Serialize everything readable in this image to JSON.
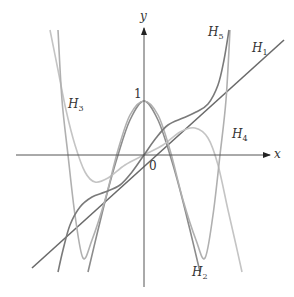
{
  "figure": {
    "axes": {
      "x_label": "x",
      "y_label": "y",
      "origin_label": "0",
      "y_tick_label": "1"
    },
    "curve_labels": [
      {
        "id": "H1",
        "base": "H",
        "sub": "1",
        "x": 252,
        "y": 42
      },
      {
        "id": "H2",
        "base": "H",
        "sub": "2",
        "x": 192,
        "y": 266
      },
      {
        "id": "H3",
        "base": "H",
        "sub": "3",
        "x": 68,
        "y": 98
      },
      {
        "id": "H4",
        "base": "H",
        "sub": "4",
        "x": 232,
        "y": 128
      },
      {
        "id": "H5",
        "base": "H",
        "sub": "5",
        "x": 208,
        "y": 26
      }
    ]
  },
  "chart_data": {
    "type": "line",
    "title": "",
    "xlabel": "x",
    "ylabel": "y",
    "grid": false,
    "legend": "inline labels",
    "annotations": [
      "1",
      "0"
    ],
    "series": [
      {
        "name": "H1",
        "color": "#6a6a6a",
        "points_px": [
          [
            32,
            268
          ],
          [
            284,
            40
          ]
        ]
      },
      {
        "name": "H2",
        "color": "#8c8c8c",
        "points_px": [
          [
            88,
            272
          ],
          [
            98,
            230
          ],
          [
            108,
            190
          ],
          [
            118,
            155
          ],
          [
            130,
            120
          ],
          [
            144,
            101
          ],
          [
            158,
            120
          ],
          [
            170,
            155
          ],
          [
            180,
            190
          ],
          [
            190,
            230
          ],
          [
            200,
            272
          ]
        ]
      },
      {
        "name": "H3",
        "color": "#c4c4c4",
        "points_px": [
          [
            50,
            30
          ],
          [
            58,
            70
          ],
          [
            66,
            110
          ],
          [
            75,
            145
          ],
          [
            85,
            172
          ],
          [
            95,
            182
          ],
          [
            108,
            178
          ],
          [
            125,
            165
          ],
          [
            144,
            155
          ],
          [
            163,
            145
          ],
          [
            180,
            132
          ],
          [
            195,
            128
          ],
          [
            208,
            138
          ],
          [
            218,
            165
          ],
          [
            228,
            210
          ],
          [
            236,
            245
          ],
          [
            242,
            272
          ]
        ]
      },
      {
        "name": "H4",
        "color": "#b0b0b0",
        "points_px": [
          [
            58,
            30
          ],
          [
            62,
            100
          ],
          [
            68,
            155
          ],
          [
            75,
            215
          ],
          [
            83,
            258
          ],
          [
            92,
            240
          ],
          [
            105,
            200
          ],
          [
            118,
            150
          ],
          [
            130,
            115
          ],
          [
            144,
            101
          ],
          [
            158,
            115
          ],
          [
            170,
            150
          ],
          [
            183,
            200
          ],
          [
            196,
            240
          ],
          [
            205,
            258
          ],
          [
            213,
            215
          ],
          [
            220,
            155
          ],
          [
            226,
            100
          ],
          [
            230,
            30
          ]
        ]
      },
      {
        "name": "H5",
        "color": "#7a7a7a",
        "points_px": [
          [
            58,
            272
          ],
          [
            63,
            250
          ],
          [
            70,
            225
          ],
          [
            80,
            207
          ],
          [
            92,
            197
          ],
          [
            105,
            192
          ],
          [
            120,
            185
          ],
          [
            132,
            172
          ],
          [
            144,
            155
          ],
          [
            156,
            138
          ],
          [
            168,
            125
          ],
          [
            183,
            118
          ],
          [
            196,
            112
          ],
          [
            208,
            104
          ],
          [
            218,
            85
          ],
          [
            224,
            60
          ],
          [
            229,
            30
          ]
        ]
      }
    ]
  }
}
